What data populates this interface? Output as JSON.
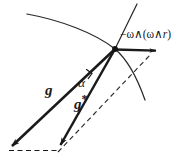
{
  "figure": {
    "background_color": "#ffffff",
    "stroke_color": "#1a1a1a",
    "width": 188,
    "height": 158,
    "labels": {
      "centrifugal": "−ω∧(ω∧",
      "centrifugal_italic_r": "r",
      "centrifugal_close": ")",
      "centrifugal_full": "−ω∧(ω∧r)",
      "gravity": "g",
      "effective_gravity": "g",
      "effective_gravity_star": "*",
      "angle": "α"
    },
    "geometry": {
      "vertex": {
        "x": 115,
        "y": 49
      },
      "gravity_arrow": {
        "from": {
          "x": 115,
          "y": 49
        },
        "to": {
          "x": 8,
          "y": 150
        }
      },
      "effective_gravity_arrow": {
        "from": {
          "x": 115,
          "y": 49
        },
        "to": {
          "x": 58,
          "y": 150
        }
      },
      "centrifugal_arrow": {
        "from": {
          "x": 115,
          "y": 49
        },
        "to": {
          "x": 162,
          "y": 51
        }
      },
      "dashed_baseline": {
        "from": {
          "x": 8,
          "y": 150
        },
        "to": {
          "x": 58,
          "y": 150
        }
      },
      "dashed_diagonal": {
        "from": {
          "x": 58,
          "y": 152
        },
        "to": {
          "x": 150,
          "y": 55
        }
      },
      "geoid_curve": {
        "start": {
          "x": 27,
          "y": 14
        },
        "end": {
          "x": 145,
          "y": 100
        }
      },
      "radial_line": {
        "from": {
          "x": 137,
          "y": 4
        },
        "to": {
          "x": 115,
          "y": 49
        }
      },
      "right_angle_marker": true
    }
  }
}
